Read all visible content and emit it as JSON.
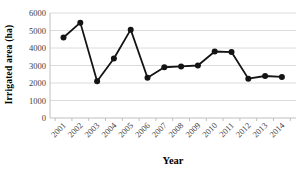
{
  "chart_data": {
    "type": "line",
    "title": "",
    "xlabel": "Year",
    "ylabel": "Irrigated area (ha)",
    "categories": [
      "2001",
      "2002",
      "2003",
      "2004",
      "2005",
      "2006",
      "2007",
      "2008",
      "2009",
      "2010",
      "2011",
      "2012",
      "2013",
      "2014"
    ],
    "series": [
      {
        "name": "Irrigated area (ha)",
        "values": [
          4600,
          5450,
          2100,
          3400,
          5050,
          2300,
          2900,
          2950,
          3000,
          3800,
          3770,
          2250,
          2400,
          2350
        ]
      }
    ],
    "ylim": [
      0,
      6000
    ],
    "yticks": [
      0,
      1000,
      2000,
      3000,
      4000,
      5000,
      6000
    ],
    "grid": "horizontal",
    "legend": "none",
    "marker": "circle"
  },
  "colors": {
    "line": "#141414",
    "marker": "#141414",
    "gridline": "#dcdcdc",
    "axis": "#bfbfbf",
    "tick_text": "#3d3d3d",
    "background": "#ffffff"
  }
}
